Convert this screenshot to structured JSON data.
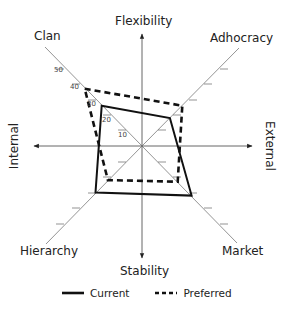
{
  "chart_data": {
    "type": "radar",
    "title": "",
    "center": [
      142,
      146
    ],
    "px_per_unit": 1.55,
    "axes_main": {
      "top": "Flexibility",
      "bottom": "Stability",
      "left": "Internal",
      "right": "External"
    },
    "quadrant_axes": [
      "Clan",
      "Adhocracy",
      "Market",
      "Hierarchy"
    ],
    "tick_labels": [
      "10",
      "20",
      "30",
      "40",
      "50"
    ],
    "tick_values": [
      10,
      20,
      30,
      40,
      50
    ],
    "range": [
      0,
      60
    ],
    "grid": false,
    "legend_position": "bottom",
    "series": [
      {
        "name": "Current",
        "style": "solid",
        "values": {
          "Clan": 26,
          "Adhocracy": 18,
          "Market": 32,
          "Hierarchy": 30
        }
      },
      {
        "name": "Preferred",
        "style": "dashed",
        "values": {
          "Clan": 37,
          "Adhocracy": 26,
          "Market": 23,
          "Hierarchy": 22
        }
      }
    ]
  },
  "labels": {
    "flexibility": "Flexibility",
    "stability": "Stability",
    "internal": "Internal",
    "external": "External",
    "clan": "Clan",
    "adhocracy": "Adhocracy",
    "market": "Market",
    "hierarchy": "Hierarchy"
  },
  "ticks": {
    "t10": "10",
    "t20": "20",
    "t30": "30",
    "t40": "40",
    "t50": "50"
  },
  "legend": {
    "current": "Current",
    "preferred": "Preferred"
  },
  "colors": {
    "line": "#111111",
    "axis": "#555555"
  }
}
